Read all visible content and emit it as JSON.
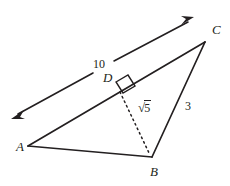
{
  "figure": {
    "type": "geometry-diagram",
    "background_color": "#ffffff",
    "stroke_color": "#231f20"
  },
  "vertices": [
    {
      "id": "A",
      "label": "A",
      "x": 28,
      "y": 146
    },
    {
      "id": "B",
      "label": "B",
      "x": 152,
      "y": 157
    },
    {
      "id": "C",
      "label": "C",
      "x": 205,
      "y": 42
    },
    {
      "id": "D",
      "label": "D",
      "x": 118,
      "y": 85
    }
  ],
  "labels": {
    "vertex_a": "A",
    "vertex_b": "B",
    "vertex_c": "C",
    "vertex_d": "D",
    "segment_ten": "10",
    "segment_three": "3",
    "altitude_radical_sign": "√",
    "altitude_radical_value": "5"
  },
  "segments": [
    {
      "name": "side-ab",
      "from": "A",
      "to": "B",
      "style": "solid",
      "measure": ""
    },
    {
      "name": "side-bc",
      "from": "B",
      "to": "C",
      "style": "solid",
      "measure": "3"
    },
    {
      "name": "side-ac",
      "from": "A",
      "to": "C",
      "style": "solid",
      "measure": ""
    },
    {
      "name": "altitude-db",
      "from": "D",
      "to": "B",
      "style": "dashed",
      "measure": "√5"
    },
    {
      "name": "arrow-line",
      "from": "lower-left",
      "to": "upper-right",
      "style": "double-headed-arrow",
      "measure": "10"
    }
  ],
  "marks": {
    "right_angle_at": "D",
    "right_angle_symbol": "square"
  }
}
